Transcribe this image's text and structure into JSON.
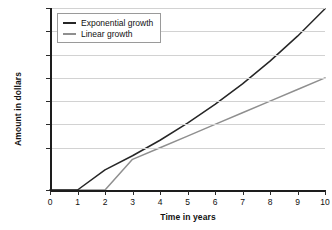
{
  "chart_data": {
    "type": "line",
    "title": "",
    "xlabel": "Time in years",
    "ylabel": "Amount in dollars",
    "xlim": [
      0,
      10
    ],
    "ylim": [
      1200,
      2600
    ],
    "y_axis_broken": true,
    "y_break_note": "axis jumps from 0 directly to 1,200",
    "grid": true,
    "legend_position": "top-left",
    "x": [
      0,
      1,
      2,
      3,
      4,
      5,
      6,
      7,
      8,
      9,
      10
    ],
    "xticklabels": [
      "0",
      "1",
      "2",
      "3",
      "4",
      "5",
      "6",
      "7",
      "8",
      "9",
      "10"
    ],
    "yticks": [
      0,
      1200,
      1400,
      1600,
      1800,
      2000,
      2200,
      2400,
      2600
    ],
    "yticklabels": [
      "0",
      "1,200",
      "1,400",
      "1,600",
      "1,800",
      "2,000",
      "2,200",
      "2,400",
      "2,600"
    ],
    "series": [
      {
        "name": "Exponential growth",
        "color": "#262626",
        "values": [
          1000,
          1100,
          1210,
          1331,
          1464.1,
          1610.51,
          1771.56,
          1948.72,
          2143.59,
          2357.95,
          2593.74
        ]
      },
      {
        "name": "Linear growth",
        "color": "#8f8f8f",
        "values": [
          1000,
          1100,
          1200,
          1300,
          1400,
          1500,
          1600,
          1700,
          1800,
          1900,
          2000
        ]
      }
    ]
  },
  "legend": {
    "items": [
      {
        "label": "Exponential growth"
      },
      {
        "label": "Linear growth"
      }
    ]
  },
  "colors": {
    "exponential": "#262626",
    "linear": "#8f8f8f",
    "grid": "#d2d2d2",
    "axis": "#1d1d1d",
    "text": "#111111",
    "background": "#ffffff"
  }
}
